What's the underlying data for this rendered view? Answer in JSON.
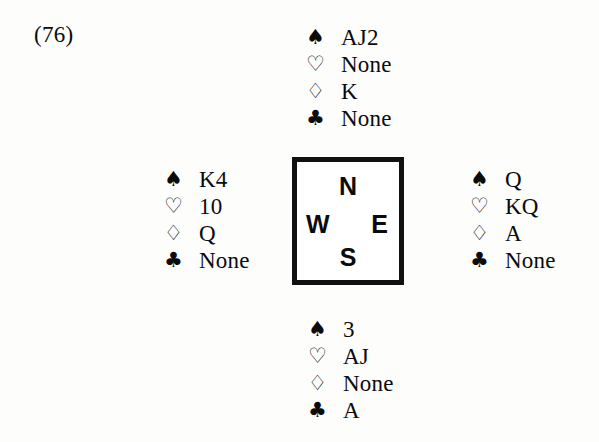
{
  "deal": {
    "label": "(76)"
  },
  "suits": {
    "spade": {
      "glyph": "♠",
      "name": "spade-symbol",
      "fill": "solid"
    },
    "heart": {
      "glyph": "♡",
      "name": "heart-symbol",
      "fill": "hollow"
    },
    "diamond": {
      "glyph": "♢",
      "name": "diamond-symbol",
      "fill": "hollow"
    },
    "club": {
      "glyph": "♣",
      "name": "club-symbol",
      "fill": "solid"
    }
  },
  "compass": {
    "north": "N",
    "west": "W",
    "east": "E",
    "south": "S",
    "border_color": "#111111"
  },
  "hands": {
    "north": {
      "seat": "North",
      "spades": "AJ2",
      "hearts": "None",
      "diamonds": "K",
      "clubs": "None"
    },
    "west": {
      "seat": "West",
      "spades": "K4",
      "hearts": "10",
      "diamonds": "Q",
      "clubs": "None"
    },
    "east": {
      "seat": "East",
      "spades": "Q",
      "hearts": "KQ",
      "diamonds": "A",
      "clubs": "None"
    },
    "south": {
      "seat": "South",
      "spades": "3",
      "hearts": "AJ",
      "diamonds": "None",
      "clubs": "A"
    }
  },
  "colors": {
    "ink": "#0b0b0b",
    "page": "#fdfdfc",
    "box_fill": "#ffffff"
  }
}
